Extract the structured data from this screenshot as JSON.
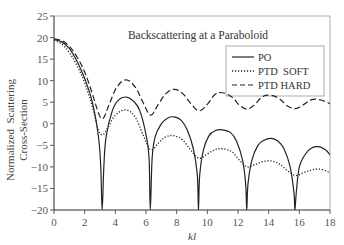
{
  "chart_data": {
    "type": "line",
    "title": "Backscattering at a Paraboloid",
    "xlabel": "kl",
    "ylabel": "Normalized Scattering Cross-Section",
    "xlim": [
      0,
      18
    ],
    "ylim": [
      -20,
      25
    ],
    "xticks": [
      0,
      2,
      4,
      6,
      8,
      10,
      12,
      14,
      16,
      18
    ],
    "yticks": [
      25,
      20,
      15,
      10,
      5,
      0,
      -5,
      -10,
      -15,
      -20
    ],
    "grid": false,
    "legend_position": "upper right",
    "series": [
      {
        "name": "PO",
        "style": "solid",
        "x": [
          0,
          0.5,
          1.0,
          1.5,
          2.0,
          2.5,
          2.9,
          3.05,
          3.14,
          3.25,
          3.4,
          3.8,
          4.2,
          4.7,
          5.2,
          5.6,
          6.0,
          6.2,
          6.28,
          6.4,
          6.6,
          7.0,
          7.4,
          7.85,
          8.3,
          8.7,
          9.1,
          9.35,
          9.42,
          9.5,
          9.75,
          10.1,
          10.5,
          11.0,
          11.5,
          11.9,
          12.3,
          12.5,
          12.57,
          12.65,
          12.9,
          13.3,
          13.7,
          14.15,
          14.6,
          15.0,
          15.4,
          15.65,
          15.71,
          15.8,
          16.0,
          16.4,
          16.8,
          17.25,
          17.7,
          18.0
        ],
        "y": [
          19.5,
          19.0,
          17.5,
          14.5,
          10.5,
          5.0,
          -3.0,
          -10.0,
          -20.0,
          -10.0,
          -3.0,
          3.0,
          5.5,
          6.2,
          5.2,
          3.0,
          -2.5,
          -8.0,
          -20.0,
          -8.0,
          -3.0,
          0.0,
          1.3,
          1.6,
          0.8,
          -1.5,
          -6.0,
          -12.0,
          -20.0,
          -12.0,
          -6.0,
          -2.8,
          -1.6,
          -1.4,
          -2.0,
          -4.0,
          -8.5,
          -14.0,
          -20.0,
          -14.0,
          -8.5,
          -5.0,
          -3.8,
          -3.4,
          -4.0,
          -5.8,
          -10.0,
          -16.0,
          -20.0,
          -16.0,
          -10.0,
          -7.0,
          -5.6,
          -5.3,
          -6.0,
          -7.2
        ]
      },
      {
        "name": "PTD SOFT",
        "style": "dotted",
        "x": [
          0,
          0.5,
          1.0,
          1.5,
          2.0,
          2.5,
          2.9,
          3.2,
          3.5,
          4.0,
          4.7,
          5.3,
          5.8,
          6.3,
          6.8,
          7.3,
          7.85,
          8.4,
          8.9,
          9.45,
          10.0,
          10.5,
          11.0,
          11.6,
          12.1,
          12.6,
          13.1,
          13.6,
          14.15,
          14.7,
          15.2,
          15.75,
          16.3,
          16.8,
          17.3,
          17.8,
          18.0
        ],
        "y": [
          19.3,
          18.5,
          16.5,
          13.5,
          9.5,
          4.0,
          -1.5,
          -2.5,
          -1.0,
          2.0,
          3.2,
          1.5,
          -2.5,
          -6.0,
          -4.5,
          -3.0,
          -2.8,
          -3.8,
          -6.0,
          -8.0,
          -7.0,
          -6.0,
          -5.8,
          -6.5,
          -8.5,
          -10.0,
          -9.5,
          -8.8,
          -8.6,
          -9.3,
          -10.8,
          -12.0,
          -11.3,
          -10.7,
          -10.5,
          -11.0,
          -11.5
        ]
      },
      {
        "name": "PTD HARD",
        "style": "dashed",
        "x": [
          0,
          0.5,
          1.0,
          1.5,
          2.0,
          2.5,
          2.9,
          3.2,
          3.6,
          4.1,
          4.7,
          5.3,
          5.8,
          6.3,
          6.8,
          7.3,
          7.85,
          8.4,
          8.9,
          9.45,
          10.0,
          10.5,
          11.0,
          11.6,
          12.1,
          12.6,
          13.1,
          13.6,
          14.15,
          14.7,
          15.2,
          15.75,
          16.3,
          16.8,
          17.3,
          17.8,
          18.0
        ],
        "y": [
          19.7,
          19.3,
          18.0,
          15.5,
          12.0,
          7.0,
          2.5,
          1.2,
          4.5,
          8.5,
          10.2,
          8.5,
          5.0,
          2.0,
          4.5,
          7.0,
          8.0,
          7.0,
          4.8,
          3.0,
          4.5,
          6.8,
          7.2,
          6.2,
          4.3,
          3.4,
          4.5,
          6.3,
          6.6,
          5.8,
          4.2,
          3.5,
          4.5,
          5.6,
          5.6,
          5.0,
          4.6
        ]
      }
    ]
  },
  "legend": {
    "items": [
      {
        "label": "PO",
        "style": "solid"
      },
      {
        "label": "PTD  SOFT",
        "style": "dotted"
      },
      {
        "label": "PTD HARD",
        "style": "dashed"
      }
    ]
  },
  "labels": {
    "title": "Backscattering at a Paraboloid",
    "xlabel": "kl",
    "ylabel_line1": "Normalized  Scattering",
    "ylabel_line2": "Cross-Section"
  },
  "colors": {
    "line": "#222222",
    "axis": "#666666",
    "frame": "#888888"
  }
}
